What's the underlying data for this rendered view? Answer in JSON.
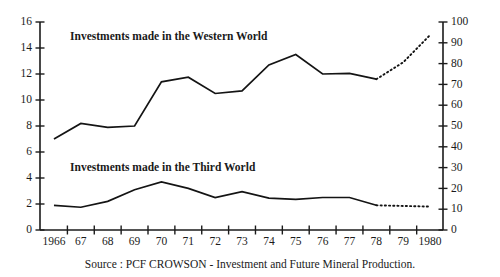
{
  "chart_data": {
    "type": "line",
    "title": "",
    "subtitle": "",
    "xlabel": "",
    "ylabel": "",
    "categories": [
      "1966",
      "67",
      "68",
      "69",
      "70",
      "71",
      "72",
      "73",
      "74",
      "75",
      "76",
      "77",
      "78",
      "79",
      "1980"
    ],
    "x": [
      1966,
      1967,
      1968,
      1969,
      1970,
      1971,
      1972,
      1973,
      1974,
      1975,
      1976,
      1977,
      1978,
      1979,
      1980
    ],
    "ylim": [
      0,
      16
    ],
    "yticks": [
      0,
      2,
      4,
      6,
      8,
      10,
      12,
      14,
      16
    ],
    "y2lim": [
      0,
      100
    ],
    "y2ticks": [
      0,
      10,
      20,
      30,
      40,
      50,
      60,
      70,
      80,
      90,
      100
    ],
    "grid": false,
    "legend_position": "inline-annotation",
    "series": [
      {
        "name": "Investments made in the Western World",
        "axis": "left",
        "style": "solid-then-dotted",
        "solid_through": 1978,
        "values": [
          7.0,
          8.2,
          7.9,
          8.0,
          11.4,
          11.75,
          10.5,
          10.7,
          12.7,
          13.5,
          12.0,
          12.05,
          11.6,
          12.9,
          15.0
        ]
      },
      {
        "name": "Investments made in the Third World",
        "axis": "left",
        "style": "solid-then-dotted",
        "solid_through": 1978,
        "values": [
          1.9,
          1.75,
          2.2,
          3.1,
          3.7,
          3.2,
          2.5,
          2.95,
          2.45,
          2.35,
          2.5,
          2.5,
          1.9,
          1.85,
          1.8
        ]
      }
    ],
    "annotations": [
      {
        "text": "Investments made in the Western World",
        "x": 1966.6,
        "y": 14.6
      },
      {
        "text": "Investments made in the Third World",
        "x": 1966.6,
        "y": 4.55
      }
    ],
    "caption": "Source : PCF CROWSON - Investment and Future Mineral Production."
  },
  "colors": {
    "line": "#141414",
    "axis": "#1b1b1b",
    "background": "#ffffff",
    "text": "#1a1a1a"
  }
}
